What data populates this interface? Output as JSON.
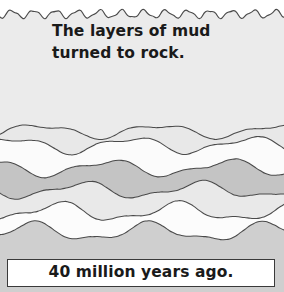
{
  "illustration": {
    "title": "Rock strata formation panel",
    "narration": "The layers of mud\nturned to rock.",
    "caption": "40 million years ago.",
    "colors": {
      "page_background": "#ffffff",
      "top_block": "#ebebeb",
      "light_gray_layer": "#e4e4e4",
      "medium_gray_layer": "#c4c4c4",
      "pale_layer": "#efefef",
      "white_layer": "#fbfbfb",
      "bottom_layer": "#cfcfcf",
      "outline": "#4a4a4a",
      "caption_border": "#3a3a3a",
      "text": "#1a1a1a"
    },
    "top_edge": {
      "style": "wavy",
      "wave_period_px": 22,
      "wave_amplitude_px": 4,
      "baseline_y": 14
    },
    "layers": [
      {
        "name": "top-mud-block",
        "fill": "#ebebeb",
        "boundary_y": 14,
        "amplitude": 4,
        "period": 22
      },
      {
        "name": "layer-1-light",
        "fill": "#e8e8e8",
        "boundary_y": 131,
        "amplitude": 6,
        "period": 120
      },
      {
        "name": "layer-2-white",
        "fill": "#fbfbfb",
        "boundary_y": 145,
        "amplitude": 7,
        "period": 118
      },
      {
        "name": "layer-3-medium",
        "fill": "#c4c4c4",
        "boundary_y": 168,
        "amplitude": 7,
        "period": 120
      },
      {
        "name": "layer-4-pale",
        "fill": "#e9e9e9",
        "boundary_y": 190,
        "amplitude": 7,
        "period": 118
      },
      {
        "name": "layer-5-white",
        "fill": "#fcfcfc",
        "boundary_y": 212,
        "amplitude": 8,
        "period": 120
      },
      {
        "name": "layer-6-bottom",
        "fill": "#cfcfcf",
        "boundary_y": 232,
        "amplitude": 8,
        "period": 118
      }
    ]
  }
}
